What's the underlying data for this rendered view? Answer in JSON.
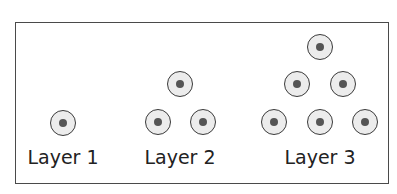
{
  "diagram": {
    "type": "layered-cell-arrangement",
    "layers": [
      {
        "label": "Layer 1",
        "cell_count": 1,
        "rows": [
          1
        ],
        "center_x": 63
      },
      {
        "label": "Layer 2",
        "cell_count": 3,
        "rows": [
          1,
          2
        ],
        "center_x": 180
      },
      {
        "label": "Layer 3",
        "cell_count": 6,
        "rows": [
          1,
          2,
          3
        ],
        "center_x": 320
      }
    ],
    "cells": [
      {
        "layer": 1,
        "x": 63,
        "y": 123
      },
      {
        "layer": 2,
        "x": 180,
        "y": 84
      },
      {
        "layer": 2,
        "x": 158,
        "y": 122
      },
      {
        "layer": 2,
        "x": 203,
        "y": 122
      },
      {
        "layer": 3,
        "x": 320,
        "y": 47
      },
      {
        "layer": 3,
        "x": 297,
        "y": 84
      },
      {
        "layer": 3,
        "x": 343,
        "y": 84
      },
      {
        "layer": 3,
        "x": 274,
        "y": 122
      },
      {
        "layer": 3,
        "x": 320,
        "y": 122
      },
      {
        "layer": 3,
        "x": 365,
        "y": 122
      }
    ],
    "colors": {
      "border": "#4a4a4a",
      "cell_fill": "#ececec",
      "nucleus": "#555555"
    }
  }
}
